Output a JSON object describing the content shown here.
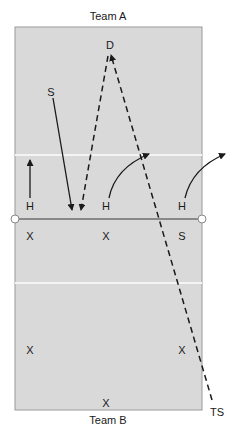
{
  "title_top": "Team A",
  "title_bottom": "Team B",
  "colors": {
    "court": "#d9d9d9",
    "court_border": "#9a9a9a",
    "lines": "#f4f4f4",
    "net": "#6e6e6e",
    "ink": "#1a1a1a"
  },
  "team_a_players": [
    {
      "label": "D",
      "role": "defender"
    },
    {
      "label": "S",
      "role": "setter"
    },
    {
      "label": "H",
      "role": "hitter-left"
    },
    {
      "label": "H",
      "role": "hitter-middle"
    },
    {
      "label": "H",
      "role": "hitter-right"
    }
  ],
  "team_b_players": [
    {
      "label": "X",
      "role": "front-left"
    },
    {
      "label": "X",
      "role": "front-middle"
    },
    {
      "label": "S",
      "role": "front-right-setter"
    },
    {
      "label": "X",
      "role": "back-left"
    },
    {
      "label": "X",
      "role": "back-right"
    },
    {
      "label": "X",
      "role": "back-middle"
    }
  ],
  "outside_label": "TS",
  "legend": {
    "solid_arrow": "player movement",
    "dashed_arrow": "ball path"
  }
}
